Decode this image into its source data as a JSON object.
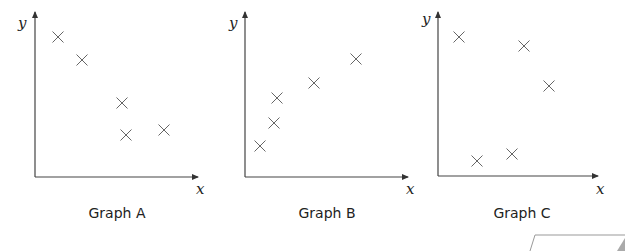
{
  "chart_data": [
    {
      "type": "scatter",
      "title": "Graph A",
      "xlabel": "x",
      "ylabel": "y",
      "grid": false,
      "marker": "cross",
      "points_px": [
        [
          58,
          37
        ],
        [
          82,
          60
        ],
        [
          122,
          103
        ],
        [
          126,
          135
        ],
        [
          164,
          130
        ]
      ],
      "axes_px": {
        "origin": [
          35,
          177
        ],
        "x_end": 198,
        "y_top": 12
      },
      "label_px": {
        "x": [
          196,
          194
        ],
        "y": [
          18,
          28
        ],
        "title": [
          117,
          218
        ]
      }
    },
    {
      "type": "scatter",
      "title": "Graph B",
      "xlabel": "x",
      "ylabel": "y",
      "grid": false,
      "marker": "cross",
      "points_px": [
        [
          260,
          146
        ],
        [
          274,
          123
        ],
        [
          277,
          98
        ],
        [
          314,
          83
        ],
        [
          356,
          59
        ]
      ],
      "axes_px": {
        "origin": [
          245,
          177
        ],
        "x_end": 408,
        "y_top": 12
      },
      "label_px": {
        "x": [
          406,
          194
        ],
        "y": [
          229,
          28
        ],
        "title": [
          327,
          218
        ]
      }
    },
    {
      "type": "scatter",
      "title": "Graph C",
      "xlabel": "x",
      "ylabel": "y",
      "grid": false,
      "marker": "cross",
      "points_px": [
        [
          459,
          37
        ],
        [
          524,
          46
        ],
        [
          549,
          86
        ],
        [
          477,
          161
        ],
        [
          512,
          154
        ]
      ],
      "axes_px": {
        "origin": [
          438,
          176
        ],
        "x_end": 598,
        "y_top": 12
      },
      "label_px": {
        "x": [
          596,
          194
        ],
        "y": [
          422,
          24
        ],
        "title": [
          522,
          218
        ]
      }
    }
  ],
  "colors": {
    "axis": "#444444",
    "marker": "#555555",
    "text": "#222222"
  }
}
